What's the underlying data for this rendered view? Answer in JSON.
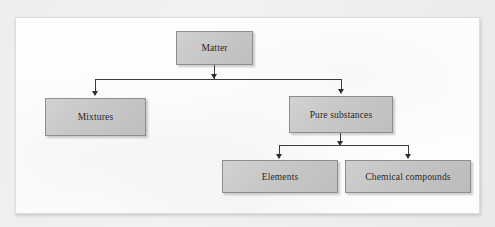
{
  "diagram": {
    "type": "hierarchy-tree",
    "root": "Matter",
    "nodes": [
      {
        "id": "matter",
        "label": "Matter",
        "level": 0
      },
      {
        "id": "mixtures",
        "label": "Mixtures",
        "level": 1
      },
      {
        "id": "pure",
        "label": "Pure substances",
        "level": 1
      },
      {
        "id": "elements",
        "label": "Elements",
        "level": 2
      },
      {
        "id": "compounds",
        "label": "Chemical compounds",
        "level": 2
      }
    ],
    "edges": [
      {
        "from": "Matter",
        "to": "Mixtures",
        "arrow": "down"
      },
      {
        "from": "Matter",
        "to": "Pure substances",
        "arrow": "down"
      },
      {
        "from": "Pure substances",
        "to": "Elements",
        "arrow": "down"
      },
      {
        "from": "Pure substances",
        "to": "Chemical compounds",
        "arrow": "down"
      }
    ],
    "colors": {
      "node_fill": "#c7c7c7",
      "node_border": "#8d8d8d",
      "connector": "#3c3c3c",
      "arrowhead": "#2e2e2e",
      "sheet": "#fdfdfc",
      "page_background": "#efefef"
    }
  }
}
